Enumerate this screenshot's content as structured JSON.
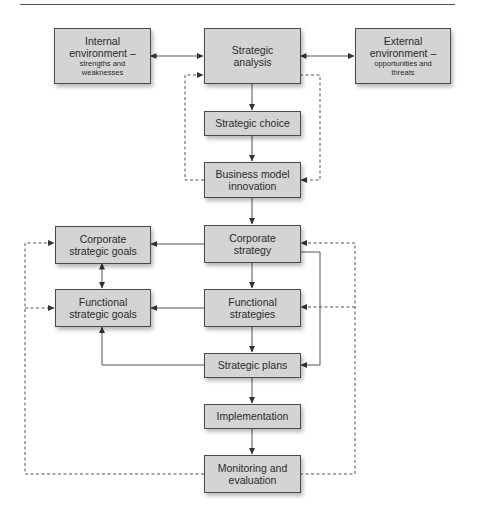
{
  "diagram": {
    "type": "flowchart",
    "nodes": {
      "internal": {
        "title_line1": "Internal",
        "title_line2": "environment –",
        "sub_line1": "strengths and",
        "sub_line2": "weaknesses"
      },
      "analysis": {
        "line1": "Strategic",
        "line2": "analysis"
      },
      "external": {
        "title_line1": "External",
        "title_line2": "environment –",
        "sub_line1": "opportunities and",
        "sub_line2": "threats"
      },
      "choice": {
        "line1": "Strategic choice"
      },
      "bmi": {
        "line1": "Business model",
        "line2": "innovation"
      },
      "corp_strategy": {
        "line1": "Corporate",
        "line2": "strategy"
      },
      "corp_goals": {
        "line1": "Corporate",
        "line2": "strategic goals"
      },
      "func_strategies": {
        "line1": "Functional",
        "line2": "strategies"
      },
      "func_goals": {
        "line1": "Functional",
        "line2": "strategic goals"
      },
      "plans": {
        "line1": "Strategic plans"
      },
      "implementation": {
        "line1": "Implementation"
      },
      "monitoring": {
        "line1": "Monitoring and",
        "line2": "evaluation"
      }
    },
    "edges": [
      {
        "from": "internal",
        "to": "analysis",
        "style": "solid",
        "bidirectional": true
      },
      {
        "from": "external",
        "to": "analysis",
        "style": "solid",
        "bidirectional": true
      },
      {
        "from": "analysis",
        "to": "choice",
        "style": "solid"
      },
      {
        "from": "choice",
        "to": "bmi",
        "style": "solid"
      },
      {
        "from": "bmi",
        "to": "analysis",
        "style": "dashed"
      },
      {
        "from": "analysis",
        "to": "bmi",
        "style": "dashed"
      },
      {
        "from": "bmi",
        "to": "corp_strategy",
        "style": "solid"
      },
      {
        "from": "corp_strategy",
        "to": "corp_goals",
        "style": "solid"
      },
      {
        "from": "corp_goals",
        "to": "func_goals",
        "style": "solid",
        "bidirectional": true
      },
      {
        "from": "corp_strategy",
        "to": "func_strategies",
        "style": "solid"
      },
      {
        "from": "func_strategies",
        "to": "func_goals",
        "style": "solid"
      },
      {
        "from": "func_strategies",
        "to": "plans",
        "style": "solid"
      },
      {
        "from": "corp_strategy",
        "to": "plans",
        "style": "solid"
      },
      {
        "from": "plans",
        "to": "func_goals",
        "style": "solid"
      },
      {
        "from": "plans",
        "to": "implementation",
        "style": "solid"
      },
      {
        "from": "implementation",
        "to": "monitoring",
        "style": "solid"
      },
      {
        "from": "monitoring",
        "to": "corp_goals",
        "style": "dashed"
      },
      {
        "from": "monitoring",
        "to": "func_goals",
        "style": "dashed"
      },
      {
        "from": "monitoring",
        "to": "corp_strategy",
        "style": "dashed"
      },
      {
        "from": "monitoring",
        "to": "func_strategies",
        "style": "dashed"
      }
    ]
  },
  "colors": {
    "box_fill": "#d4d4d4",
    "box_border": "#4a4a4a",
    "line": "#444444",
    "text": "#2a2a2a"
  }
}
